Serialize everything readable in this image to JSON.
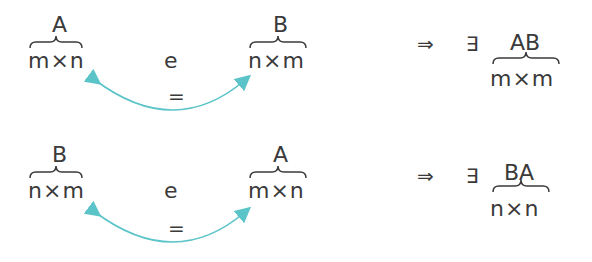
{
  "colors": {
    "text": "#3a3a3a",
    "arrow": "#5bc4c8"
  },
  "rows": [
    {
      "left": {
        "label": "A",
        "dim": "m×n"
      },
      "middle": "e",
      "right": {
        "label": "B",
        "dim": "n×m"
      },
      "equals": "=",
      "implies": "⇒",
      "exists": "∃",
      "result": {
        "label": "AB",
        "dim": "m×m"
      }
    },
    {
      "left": {
        "label": "B",
        "dim": "n×m"
      },
      "middle": "e",
      "right": {
        "label": "A",
        "dim": "m×n"
      },
      "equals": "=",
      "implies": "⇒",
      "exists": "∃",
      "result": {
        "label": "BA",
        "dim": "n×n"
      }
    }
  ]
}
